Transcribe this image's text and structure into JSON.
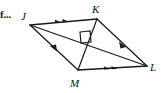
{
  "figure": {
    "kind": "quadrilateral-with-diagonals",
    "shape_name": "rhombus JKLM",
    "truncated_text": "f...",
    "stroke_color": "#1a1a1a",
    "background_color": "#ffffff",
    "vertices": [
      {
        "id": "J",
        "label": "J",
        "x": 30,
        "y": 25
      },
      {
        "id": "K",
        "label": "K",
        "x": 97,
        "y": 19
      },
      {
        "id": "L",
        "label": "L",
        "x": 147,
        "y": 66
      },
      {
        "id": "M",
        "label": "M",
        "x": 78,
        "y": 70
      }
    ],
    "sides": [
      {
        "id": "JK",
        "from": "J",
        "to": "K",
        "tick_marks": 2,
        "mark_type": "arrowhead"
      },
      {
        "id": "KL",
        "from": "K",
        "to": "L",
        "tick_marks": 1,
        "mark_type": "arrowhead"
      },
      {
        "id": "ML",
        "from": "M",
        "to": "L",
        "tick_marks": 2,
        "mark_type": "arrowhead"
      },
      {
        "id": "JM",
        "from": "M",
        "to": "J",
        "tick_marks": 1,
        "mark_type": "arrowhead"
      }
    ],
    "diagonals": [
      {
        "id": "JL",
        "from": "J",
        "to": "L"
      },
      {
        "id": "KM",
        "from": "K",
        "to": "M"
      }
    ],
    "right_angle": {
      "at": "diagonal-intersection",
      "x": 87,
      "y": 44,
      "size": 11,
      "label": "90"
    }
  }
}
